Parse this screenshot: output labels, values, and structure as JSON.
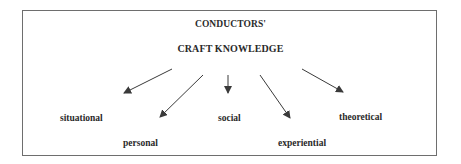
{
  "diagram": {
    "title_line1": "CONDUCTORS'",
    "title_line2": "CRAFT KNOWLEDGE",
    "categories": [
      {
        "label": "situational"
      },
      {
        "label": "personal"
      },
      {
        "label": "social"
      },
      {
        "label": "experiential"
      },
      {
        "label": "theoretical"
      }
    ],
    "colors": {
      "text": "#2a2a2a",
      "arrow": "#3a3a3a",
      "border": "#6e6e6e"
    }
  }
}
